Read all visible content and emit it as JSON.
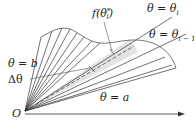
{
  "figure": {
    "labels": {
      "f_label": "f(θ",
      "f_star": "*",
      "f_sub": "i",
      "f_close": ")",
      "theta_i": "θ = θ",
      "theta_i_sub": "i",
      "theta_im1": "θ = θ",
      "theta_im1_sub": "i − 1",
      "theta_b": "θ = b",
      "delta_theta": "Δθ",
      "theta_a": "θ = a",
      "origin": "O"
    },
    "colors": {
      "line": "#333333",
      "highlight_sector": "#e6e6e6",
      "curve": "#555555"
    }
  }
}
